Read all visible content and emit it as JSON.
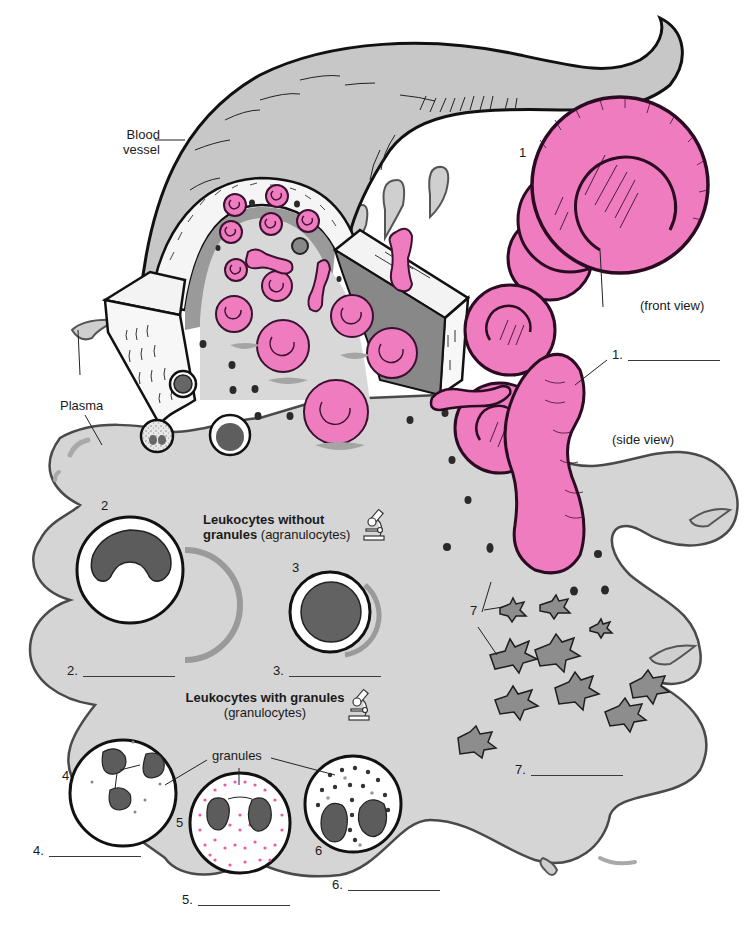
{
  "diagram": {
    "colors": {
      "plasma_fill": "#d4d4d4",
      "plasma_stroke": "#444444",
      "vessel_fill": "#c9c9c9",
      "vessel_wall": "#f4f4f4",
      "erythrocyte_fill": "#f07cc0",
      "erythrocyte_stroke": "#3a1230",
      "nucleus_fill": "#6b6b6b",
      "nucleus_dark": "#555555",
      "granule_pink": "#ec5aa6",
      "platelet_fill": "#8d8d8d",
      "line": "#222222"
    },
    "labels": {
      "blood_vessel": [
        "Blood",
        "vessel"
      ],
      "plasma": "Plasma",
      "front_view": "(front view)",
      "side_view": "(side view)",
      "agranulocytes_heading_bold": "Leukocytes without",
      "agranulocytes_heading_bold2": "granules",
      "agranulocytes_heading_normal": "(agranulocytes)",
      "granulocytes_heading_bold": "Leukocytes with granules",
      "granulocytes_heading_normal": "(granulocytes)",
      "granules": "granules"
    },
    "markers": [
      {
        "id": "1",
        "text": "1"
      },
      {
        "id": "2",
        "text": "2"
      },
      {
        "id": "3",
        "text": "3"
      },
      {
        "id": "4",
        "text": "4"
      },
      {
        "id": "5",
        "text": "5"
      },
      {
        "id": "6",
        "text": "6"
      },
      {
        "id": "7",
        "text": "7"
      }
    ],
    "answer_blanks": [
      {
        "number": "1.",
        "value": ""
      },
      {
        "number": "2.",
        "value": ""
      },
      {
        "number": "3.",
        "value": ""
      },
      {
        "number": "4.",
        "value": ""
      },
      {
        "number": "5.",
        "value": ""
      },
      {
        "number": "6.",
        "value": ""
      },
      {
        "number": "7.",
        "value": ""
      }
    ],
    "icons": {
      "microscope_1": "microscope-icon",
      "microscope_2": "microscope-icon"
    }
  }
}
